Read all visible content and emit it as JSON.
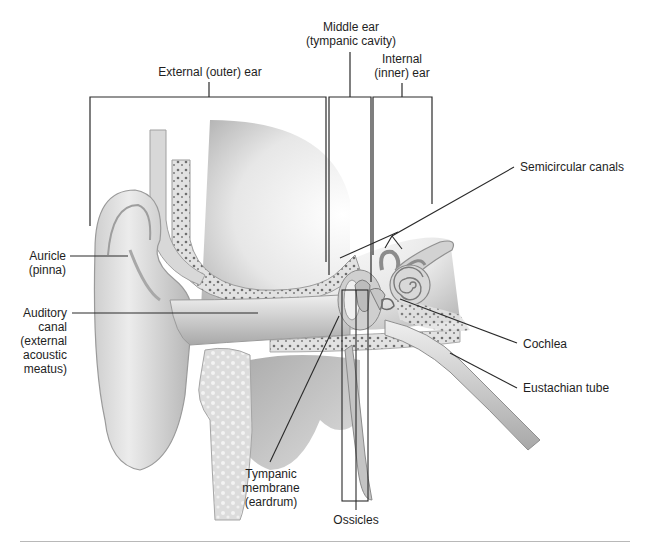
{
  "diagram": {
    "regions": {
      "external": "External (outer) ear",
      "middle_line1": "Middle ear",
      "middle_line2": "(tympanic cavity)",
      "internal_line1": "Internal",
      "internal_line2": "(inner) ear"
    },
    "labels": {
      "auricle_line1": "Auricle",
      "auricle_line2": "(pinna)",
      "canal_line1": "Auditory",
      "canal_line2": "canal",
      "canal_line3": "(external",
      "canal_line4": "acoustic",
      "canal_line5": "meatus)",
      "semicircular": "Semicircular canals",
      "cochlea": "Cochlea",
      "eustachian": "Eustachian tube",
      "tympanic_line1": "Tympanic",
      "tympanic_line2": "membrane",
      "tympanic_line3": "(eardrum)",
      "ossicles": "Ossicles"
    },
    "colors": {
      "leader_line": "#2a2a2a",
      "tissue_light": "#e6e6e6",
      "tissue_mid": "#bdbdbd",
      "tissue_dark": "#8a8a8a",
      "bone_spot": "#6e6e6e",
      "rule": "#b8b8b8"
    }
  }
}
